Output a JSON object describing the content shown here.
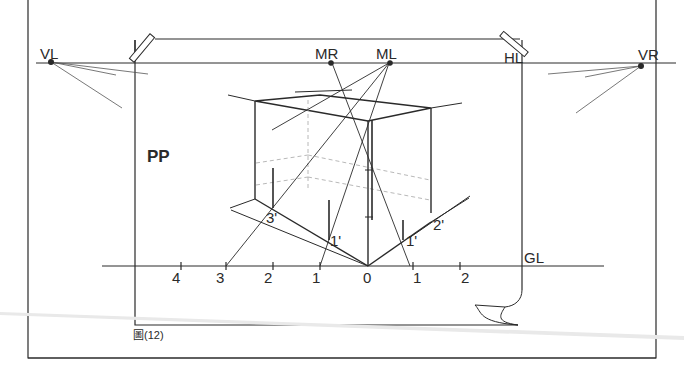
{
  "figure": {
    "caption": "圖(12)",
    "picture_plane_label": "PP"
  },
  "horizon": {
    "label": "HL",
    "vanishing_left": "VL",
    "vanishing_right": "VR",
    "measuring_right": "MR",
    "measuring_left": "ML"
  },
  "ground_line": {
    "label": "GL",
    "ticks": [
      "4",
      "3",
      "2",
      "1",
      "0",
      "1",
      "2"
    ]
  },
  "cube_marks": {
    "left_3": "3'",
    "left_1": "1'",
    "right_1": "1'",
    "right_2": "2'"
  },
  "colors": {
    "ink": "#2a2a2a",
    "light_ink": "#9a9a9a",
    "paper": "#ffffff"
  }
}
